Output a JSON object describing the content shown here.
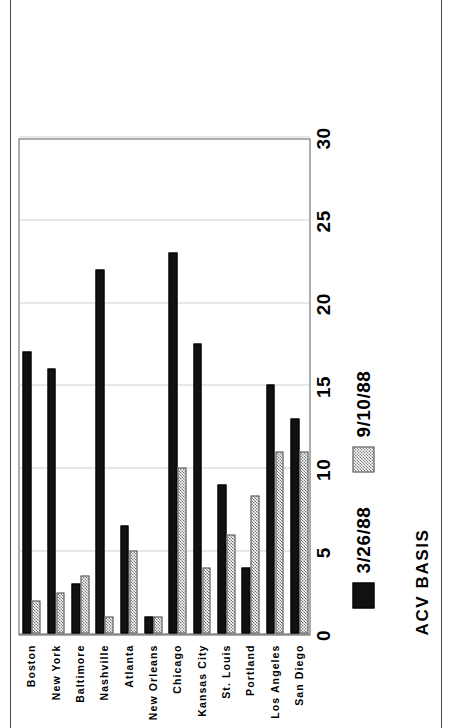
{
  "footer": {
    "basis_label": "ACV BASIS"
  },
  "legend": {
    "position": "below-plot",
    "items": [
      {
        "label": "3/26/88",
        "swatch": "solid-black-swatch",
        "color": "#111111"
      },
      {
        "label": "9/10/88",
        "swatch": "hatched-gray-swatch",
        "color": "#7a7a7a"
      }
    ]
  },
  "axis": {
    "value_ticks": [
      "0",
      "5",
      "10",
      "15",
      "20",
      "25",
      "30"
    ]
  },
  "chart_data": {
    "type": "bar",
    "title": "",
    "subtitle": "",
    "xlabel": "",
    "ylabel": "",
    "annotations": [
      "ACV BASIS"
    ],
    "orientation": "vertical-bars-on-rotated-page",
    "grid": true,
    "legend_position": "below",
    "ylim": [
      0,
      30
    ],
    "yticks": [
      0,
      5,
      10,
      15,
      20,
      25,
      30
    ],
    "categories": [
      "Boston",
      "New York",
      "Baltimore",
      "Nashville",
      "Atlanta",
      "New Orleans",
      "Chicago",
      "Kansas City",
      "St. Louis",
      "Portland",
      "Los Angeles",
      "San Diego"
    ],
    "series": [
      {
        "name": "3/26/88",
        "color": "#111111",
        "pattern": "solid",
        "values": [
          17,
          16,
          3,
          22,
          6.5,
          1,
          23,
          17.5,
          9,
          4,
          15,
          13
        ]
      },
      {
        "name": "9/10/88",
        "color": "#7a7a7a",
        "pattern": "checker",
        "values": [
          2,
          2.5,
          3.5,
          1,
          5,
          1,
          10,
          4,
          6,
          8.3,
          11,
          11
        ]
      }
    ]
  }
}
